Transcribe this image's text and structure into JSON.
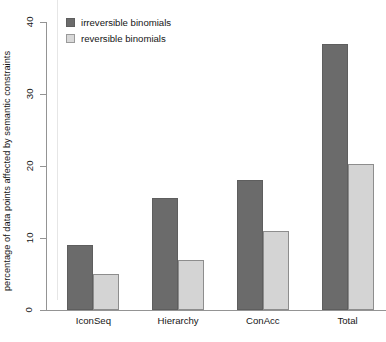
{
  "chart_data": {
    "type": "bar",
    "title": "",
    "xlabel": "",
    "ylabel": "percentage of data points affected by semantic constraints",
    "categories": [
      "IconSeq",
      "Hierarchy",
      "ConAcc",
      "Total"
    ],
    "series": [
      {
        "name": "irreversible binomials",
        "color": "#6b6b6b",
        "values": [
          9,
          15.5,
          18,
          37
        ]
      },
      {
        "name": "reversible binomials",
        "color": "#d4d4d4",
        "values": [
          5,
          7,
          11,
          20.3
        ]
      }
    ],
    "ylim": [
      0,
      40
    ],
    "yticks": [
      0,
      10,
      20,
      30,
      40
    ],
    "ytick_labels": [
      "0",
      "10",
      "20",
      "30",
      "40"
    ],
    "grid": false,
    "legend_position": "top-left"
  },
  "legend": {
    "items": [
      {
        "label": "irreversible binomials",
        "swatch": "dark-swatch-icon"
      },
      {
        "label": "reversible binomials",
        "swatch": "light-swatch-icon"
      }
    ]
  }
}
